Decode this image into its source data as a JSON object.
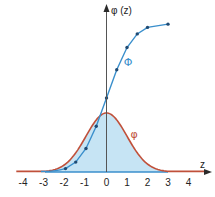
{
  "chart_data": {
    "type": "line",
    "title": "",
    "xlabel": "z",
    "ylabel": "φ (z)",
    "xlim": [
      -4.5,
      5
    ],
    "ylim": [
      0,
      1.05
    ],
    "x_ticks": [
      -4,
      -3,
      -2,
      -1,
      0,
      1,
      2,
      3,
      4
    ],
    "x_tick_labels": [
      "-4",
      "-3",
      "-2",
      "-1",
      "0",
      "1",
      "2",
      "3",
      "4"
    ],
    "grid": false,
    "legend": "none (inline labels)",
    "series": [
      {
        "name": "φ",
        "kind": "probability density (standard normal)",
        "color": "#c0503a",
        "fill": "#c6e4f4",
        "fill_range": [
          -3,
          3
        ],
        "x_range": [
          -4.4,
          4.8
        ],
        "peak": {
          "x": 0,
          "y": 0.399
        },
        "label_position": {
          "x": 1.35,
          "y": 0.26
        }
      },
      {
        "name": "Φ",
        "kind": "cumulative distribution (standard normal)",
        "color": "#3a8fcc",
        "x": [
          -2,
          -1.5,
          -1,
          -0.5,
          0,
          0.5,
          1,
          1.5,
          2,
          3
        ],
        "values": [
          0.023,
          0.067,
          0.159,
          0.309,
          0.5,
          0.691,
          0.841,
          0.933,
          0.977,
          0.999
        ],
        "label_position": {
          "x": 1.05,
          "y": 0.74
        }
      }
    ]
  },
  "labels": {
    "y_axis": "φ (z)",
    "x_axis": "z",
    "pdf": "φ",
    "cdf": "Φ"
  },
  "colors": {
    "pdf": "#c0503a",
    "cdf": "#3a8fcc",
    "fill": "#c6e4f4",
    "axis": "#2a2a2a",
    "baseline": "#3a8fcc"
  }
}
